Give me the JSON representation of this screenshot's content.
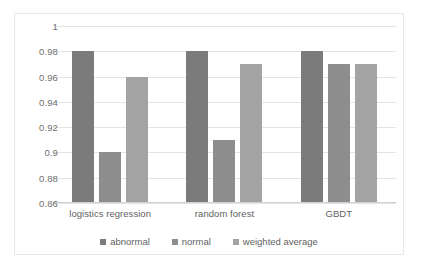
{
  "chart_data": {
    "type": "bar",
    "title": "",
    "subtitle": "",
    "xlabel": "",
    "ylabel": "",
    "categories": [
      "logistics regression",
      "random forest",
      "GBDT"
    ],
    "series": [
      {
        "name": "abnormal",
        "values": [
          0.98,
          0.98,
          0.98
        ],
        "color": "#7b7b7b"
      },
      {
        "name": "normal",
        "values": [
          0.9,
          0.91,
          0.97
        ],
        "color": "#8d8d8d"
      },
      {
        "name": "weighted average",
        "values": [
          0.96,
          0.97,
          0.97
        ],
        "color": "#a3a3a3"
      }
    ],
    "ylim": [
      0.86,
      1.0
    ],
    "ytick_step": 0.02,
    "ytick_labels": [
      "1",
      "0.98",
      "0.96",
      "0.94",
      "0.92",
      "0.9",
      "0.88",
      "0.86"
    ],
    "ytick_values": [
      1.0,
      0.98,
      0.96,
      0.94,
      0.92,
      0.9,
      0.88,
      0.86
    ],
    "grid": true,
    "grid_axis": "y",
    "legend_position": "bottom",
    "background_color": "#ffffff",
    "grid_color": "#e4e4e4",
    "text_color": "#5f5f5f",
    "border_color": "#e9e9e9"
  }
}
